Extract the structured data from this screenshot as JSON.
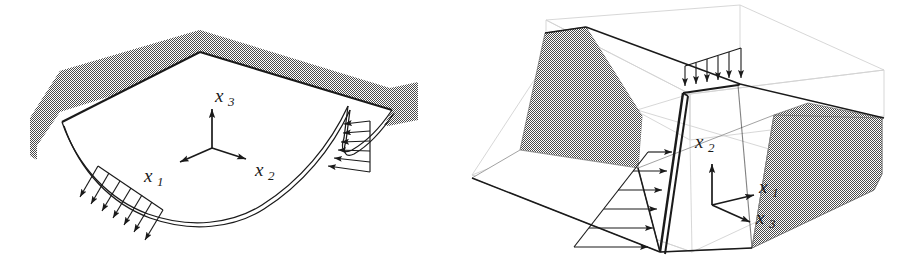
{
  "figure": {
    "background_color": "#ffffff",
    "ink_color": "#1a1a1a",
    "shading_color": "#9a9a9a",
    "construction_color": "#cfcfcf",
    "panel_count": 2
  },
  "panels": [
    {
      "id": "left",
      "name": "curved-plate-with-edge-loads",
      "description": "Square plate clamped along two adjacent edges, deflected downward, with distributed edge loads on the two free edges",
      "axes": {
        "origin": [
          212,
          148
        ],
        "labels": [
          {
            "base": "x",
            "sub": "1",
            "text": "x1",
            "direction": "left-down",
            "tip": [
              178,
              163
            ],
            "label_pos": [
              150,
              182
            ]
          },
          {
            "base": "x",
            "sub": "2",
            "text": "x2",
            "direction": "right-down",
            "tip": [
              248,
              160
            ],
            "label_pos": [
              258,
              171
            ]
          },
          {
            "base": "x",
            "sub": "3",
            "text": "x3",
            "direction": "up",
            "tip": [
              212,
              107
            ],
            "label_pos": [
              219,
              101
            ]
          }
        ]
      },
      "supports": [
        {
          "name": "clamped-edge-back-left",
          "style": "stippled-gray-band"
        },
        {
          "name": "clamped-edge-back-right",
          "style": "stippled-gray-band"
        }
      ],
      "loads": [
        {
          "name": "load-right-edge",
          "arrow_count": 6,
          "direction": "leftward",
          "profile": "uniform"
        },
        {
          "name": "load-left-edge",
          "arrow_count": 7,
          "direction": "down-left",
          "profile": "uniform"
        }
      ]
    },
    {
      "id": "right",
      "name": "retaining-wall-in-soil-block",
      "description": "Vertical retaining wall inside a wireframe soil block with stippled gray embankment wedges, loaded on top and laterally",
      "axes": {
        "origin": [
          712,
          205
        ],
        "labels": [
          {
            "base": "x",
            "sub": "1",
            "text": "x1",
            "direction": "right-up",
            "tip": [
              756,
              196
            ],
            "label_pos": [
              730,
              168
            ]
          },
          {
            "base": "x",
            "sub": "2",
            "text": "x2",
            "direction": "up",
            "tip": [
              712,
              163
            ],
            "label_pos": [
              698,
              144
            ]
          },
          {
            "base": "x",
            "sub": "3",
            "text": "x3",
            "direction": "right-down",
            "tip": [
              752,
              222
            ],
            "label_pos": [
              726,
              191
            ]
          }
        ]
      },
      "supports": [
        {
          "name": "embankment-wedge-left",
          "style": "stippled-gray-polygon"
        },
        {
          "name": "embankment-wedge-right",
          "style": "stippled-gray-polygon"
        }
      ],
      "loads": [
        {
          "name": "load-top-edge",
          "arrow_count": 6,
          "direction": "downward",
          "profile": "uniform"
        },
        {
          "name": "load-wall-face",
          "arrow_count": 6,
          "direction": "rightward",
          "profile": "triangular-increasing-downward"
        }
      ]
    }
  ]
}
